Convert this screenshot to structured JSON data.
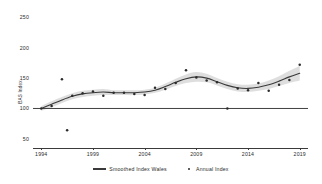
{
  "chart_data": {
    "type": "line",
    "title": "",
    "xlabel": "",
    "ylabel": "BAS Index",
    "xlim": [
      1993.2,
      2019.8
    ],
    "ylim": [
      35,
      262
    ],
    "grid": false,
    "legend_position": "bottom-center",
    "y_ticks": [
      250,
      200,
      150,
      100,
      50
    ],
    "x_ticks": [
      1994,
      1999,
      2004,
      2009,
      2014,
      2019
    ],
    "reference_line": {
      "y": 100,
      "label": "100"
    },
    "series": [
      {
        "name": "Smoothed Index Wales",
        "type": "line",
        "color": "#3a3a3a",
        "x": [
          1994,
          1995,
          1996,
          1997,
          1998,
          1999,
          2000,
          2001,
          2002,
          2003,
          2004,
          2005,
          2006,
          2007,
          2008,
          2009,
          2010,
          2011,
          2012,
          2013,
          2014,
          2015,
          2016,
          2017,
          2018,
          2019
        ],
        "values": [
          100,
          107,
          114,
          120,
          124,
          126,
          127,
          126,
          126,
          126,
          127,
          130,
          136,
          143,
          149,
          152,
          150,
          144,
          138,
          134,
          133,
          135,
          139,
          145,
          152,
          158
        ]
      },
      {
        "name": "Smoothed Index Wales CI",
        "type": "band",
        "color": "#c9c9c9",
        "x": [
          1994,
          1995,
          1996,
          1997,
          1998,
          1999,
          2000,
          2001,
          2002,
          2003,
          2004,
          2005,
          2006,
          2007,
          2008,
          2009,
          2010,
          2011,
          2012,
          2013,
          2014,
          2015,
          2016,
          2017,
          2018,
          2019
        ],
        "lower": [
          96,
          102,
          109,
          115,
          119,
          121,
          122,
          122,
          122,
          122,
          123,
          126,
          131,
          137,
          142,
          144,
          143,
          138,
          132,
          128,
          127,
          129,
          132,
          137,
          142,
          146
        ],
        "upper": [
          104,
          112,
          119,
          125,
          129,
          131,
          132,
          130,
          130,
          130,
          131,
          134,
          141,
          149,
          156,
          160,
          157,
          150,
          144,
          140,
          139,
          141,
          146,
          153,
          162,
          170
        ]
      },
      {
        "name": "Annual Index",
        "type": "scatter",
        "color": "#2b2b2b",
        "x": [
          1994,
          1995,
          1996,
          1996.5,
          1997,
          1998,
          1999,
          2000,
          2001,
          2002,
          2003,
          2004,
          2005,
          2006,
          2007,
          2008,
          2009,
          2010,
          2011,
          2012,
          2013,
          2014,
          2015,
          2016,
          2017,
          2018,
          2019
        ],
        "values": [
          100,
          104,
          148,
          64,
          121,
          125,
          128,
          121,
          126,
          126,
          124,
          122,
          134,
          132,
          142,
          163,
          151,
          146,
          143,
          100,
          133,
          130,
          142,
          129,
          139,
          147,
          172
        ]
      }
    ],
    "legend": [
      {
        "label": "Smoothed Index Wales",
        "marker": "line",
        "color": "#3a3a3a"
      },
      {
        "label": "Annual Index",
        "marker": "dot",
        "color": "#2b2b2b"
      }
    ]
  }
}
